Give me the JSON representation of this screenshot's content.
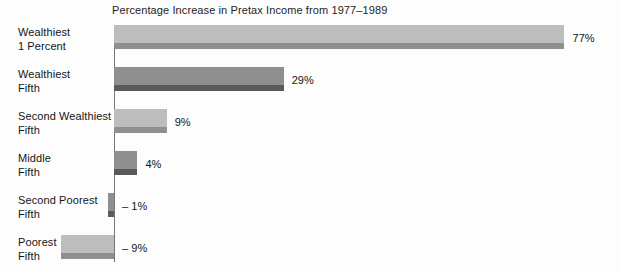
{
  "chart_data": {
    "type": "bar",
    "orientation": "horizontal",
    "title": "Percentage Increase in Pretax Income from 1977–1989",
    "xlabel": "",
    "ylabel": "",
    "grid": false,
    "legend": null,
    "xlim": [
      -9,
      77
    ],
    "zero_axis": true,
    "categories": [
      "Wealthiest 1 Percent",
      "Wealthiest Fifth",
      "Second Wealthiest Fifth",
      "Middle Fifth",
      "Second Poorest Fifth",
      "Poorest Fifth"
    ],
    "values": [
      77,
      29,
      9,
      4,
      -1,
      -9
    ],
    "value_labels": [
      "77%",
      "29%",
      "9%",
      "4%",
      "– 1%",
      "– 9%"
    ],
    "bars": [
      {
        "category_line1": "Wealthiest",
        "category_line2": "1 Percent",
        "value": 77,
        "value_label": "77%",
        "fill": "light",
        "negative": false
      },
      {
        "category_line1": "Wealthiest",
        "category_line2": "Fifth",
        "value": 29,
        "value_label": "29%",
        "fill": "dark",
        "negative": false
      },
      {
        "category_line1": "Second Wealthiest",
        "category_line2": "Fifth",
        "value": 9,
        "value_label": "9%",
        "fill": "light",
        "negative": false
      },
      {
        "category_line1": "Middle",
        "category_line2": "Fifth",
        "value": 4,
        "value_label": "4%",
        "fill": "dark",
        "negative": false
      },
      {
        "category_line1": "Second Poorest",
        "category_line2": "Fifth",
        "value": -1,
        "value_label": "– 1%",
        "fill": "dark",
        "negative": true
      },
      {
        "category_line1": "Poorest",
        "category_line2": "Fifth",
        "value": -9,
        "value_label": "– 9%",
        "fill": "light",
        "negative": true
      }
    ],
    "colors": {
      "bar_light": "#bdbdbd",
      "bar_light_shadow": "#8f8f8f",
      "bar_dark": "#8f8f8f",
      "bar_dark_shadow": "#5a5a5a",
      "axis": "#767676",
      "text": "#151515",
      "background": "#fdfdfd"
    }
  }
}
